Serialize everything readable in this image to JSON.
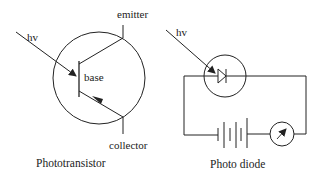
{
  "phototransistor": {
    "caption": "Phototransistor",
    "labels": {
      "light": "hv",
      "emitter": "emitter",
      "base": "base",
      "collector": "collector"
    }
  },
  "photodiode": {
    "caption": "Photo diode",
    "labels": {
      "light": "hv"
    },
    "components": [
      "photodiode",
      "battery",
      "meter"
    ]
  },
  "colors": {
    "line": "#222222",
    "background": "#ffffff"
  }
}
